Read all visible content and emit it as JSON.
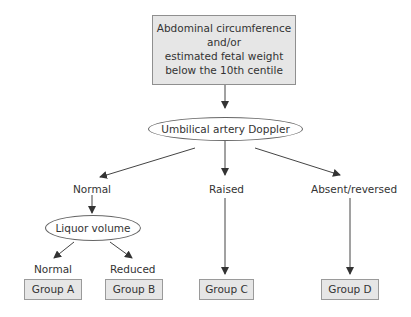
{
  "diagram": {
    "type": "flowchart",
    "start_box": {
      "lines": [
        "Abdominal circumference",
        "and/or",
        "estimated fetal weight",
        "below the 10th centile"
      ]
    },
    "test_node": "Umbilical artery Doppler",
    "branches": {
      "normal": "Normal",
      "raised": "Raised",
      "absent_reversed": "Absent/reversed"
    },
    "sub_test_node": "Liquor volume",
    "sub_branches": {
      "normal": "Normal",
      "reduced": "Reduced"
    },
    "groups": {
      "a": "Group A",
      "b": "Group B",
      "c": "Group C",
      "d": "Group D"
    },
    "colors": {
      "box_fill": "#e6e6e6",
      "box_border": "#8f8f8f",
      "line": "#444444",
      "text": "#333333"
    }
  }
}
